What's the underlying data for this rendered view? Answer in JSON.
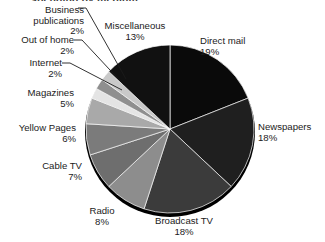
{
  "title": "...spending by medium.",
  "chart_data": {
    "type": "pie",
    "title": "...spending by medium.",
    "xlabel": "",
    "ylabel": "",
    "units": "percent",
    "start_angle_deg": 0,
    "direction": "clockwise",
    "legend": "none (direct labels with leader lines)",
    "grid": false,
    "categories": [
      "Direct mail",
      "Newspapers",
      "Broadcast TV",
      "Radio",
      "Cable TV",
      "Yellow Pages",
      "Magazines",
      "Internet",
      "Out of home",
      "Business publications",
      "Miscellaneous"
    ],
    "values": [
      19,
      18,
      18,
      8,
      7,
      6,
      5,
      2,
      2,
      2,
      13
    ],
    "value_labels": [
      "19%",
      "18%",
      "18%",
      "8%",
      "7%",
      "6%",
      "5%",
      "2%",
      "2%",
      "2%",
      "13%"
    ],
    "colors": [
      "#0a0a0a",
      "#1f1f1f",
      "#3b3b3b",
      "#8d8d8d",
      "#6e6e6e",
      "#7b7b7b",
      "#a9a9a9",
      "#e4e4e4",
      "#8f8f8f",
      "#c9c9c9",
      "#111111"
    ]
  },
  "slices": [
    {
      "name": "direct-mail",
      "label": "Direct mail",
      "pct": "19%",
      "value": 19,
      "color": "#0a0a0a"
    },
    {
      "name": "newspapers",
      "label": "Newspapers",
      "pct": "18%",
      "value": 18,
      "color": "#1f1f1f"
    },
    {
      "name": "broadcast-tv",
      "label": "Broadcast TV",
      "pct": "18%",
      "value": 18,
      "color": "#3b3b3b"
    },
    {
      "name": "radio",
      "label": "Radio",
      "pct": "8%",
      "value": 8,
      "color": "#8d8d8d"
    },
    {
      "name": "cable-tv",
      "label": "Cable TV",
      "pct": "7%",
      "value": 7,
      "color": "#6e6e6e"
    },
    {
      "name": "yellow-pages",
      "label": "Yellow Pages",
      "pct": "6%",
      "value": 6,
      "color": "#7b7b7b"
    },
    {
      "name": "magazines",
      "label": "Magazines",
      "pct": "5%",
      "value": 5,
      "color": "#a9a9a9"
    },
    {
      "name": "internet",
      "label": "Internet",
      "pct": "2%",
      "value": 2,
      "color": "#e4e4e4"
    },
    {
      "name": "out-of-home",
      "label": "Out of home",
      "pct": "2%",
      "value": 2,
      "color": "#8f8f8f"
    },
    {
      "name": "business-publications",
      "label": "Business\npublications",
      "pct": "2%",
      "value": 2,
      "color": "#c9c9c9"
    },
    {
      "name": "miscellaneous",
      "label": "Miscellaneous",
      "pct": "13%",
      "value": 13,
      "color": "#111111"
    }
  ],
  "labels": {
    "business_publications_l1": "Business",
    "business_publications_l2": "publications",
    "business_publications_pct": "2%",
    "out_of_home": "Out of home",
    "out_of_home_pct": "2%",
    "internet": "Internet",
    "internet_pct": "2%",
    "magazines": "Magazines",
    "magazines_pct": "5%",
    "yellow_pages": "Yellow Pages",
    "yellow_pages_pct": "6%",
    "cable_tv": "Cable TV",
    "cable_tv_pct": "7%",
    "radio": "Radio",
    "radio_pct": "8%",
    "broadcast_tv": "Broadcast TV",
    "broadcast_tv_pct": "18%",
    "newspapers": "Newspapers",
    "newspapers_pct": "18%",
    "direct_mail": "Direct mail",
    "direct_mail_pct": "19%",
    "miscellaneous": "Miscellaneous",
    "miscellaneous_pct": "13%"
  }
}
